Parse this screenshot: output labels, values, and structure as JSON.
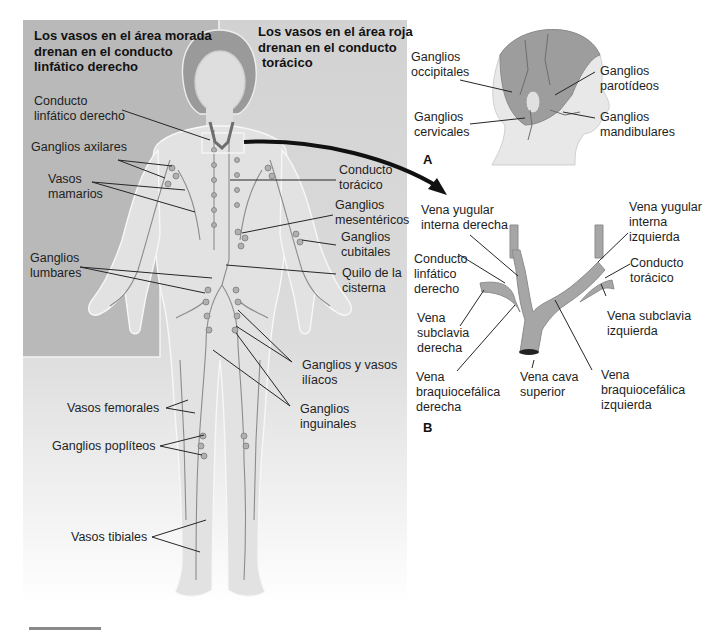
{
  "figure": {
    "colors": {
      "purple_region": "#b8b8b8",
      "red_region": "#c9c9c9",
      "body_fill": "#e4e4e4",
      "vessel": "#8c8c8c",
      "leader_line": "#2a2a2a",
      "background": "#ffffff"
    },
    "main_panel": {
      "header_left": [
        "Los vasos en el área morada",
        "drenan en el conducto",
        "linfático derecho"
      ],
      "header_right": [
        "Los vasos en el área roja",
        "drenan en el conducto",
        "torácico"
      ],
      "labels": {
        "conducto_linfatico_derecho": [
          "Conducto",
          "linfático derecho"
        ],
        "ganglios_axilares": [
          "Ganglios axilares"
        ],
        "vasos_mamarios": [
          "Vasos",
          "mamarios"
        ],
        "conducto_toracico": [
          "Conducto",
          "torácico"
        ],
        "ganglios_mesentericos": [
          "Ganglios",
          "mesentéricos"
        ],
        "ganglios_cubitales": [
          "Ganglios",
          "cubitales"
        ],
        "ganglios_lumbares": [
          "Ganglios",
          "lumbares"
        ],
        "quilo_cisterna": [
          "Quilo de la",
          "cisterna"
        ],
        "ganglios_vasos_iliacos": [
          "Ganglios y vasos",
          "ilíacos"
        ],
        "vasos_femorales": [
          "Vasos femorales"
        ],
        "ganglios_inguinales": [
          "Ganglios",
          "inguinales"
        ],
        "ganglios_popliteos": [
          "Ganglios poplíteos"
        ],
        "vasos_tibiales": [
          "Vasos tibiales"
        ]
      }
    },
    "panel_a": {
      "letter": "A",
      "labels": {
        "ganglios_occipitales": [
          "Ganglios",
          "occipitales"
        ],
        "ganglios_parotideos": [
          "Ganglios",
          "parotídeos"
        ],
        "ganglios_cervicales": [
          "Ganglios",
          "cervicales"
        ],
        "ganglios_mandibulares": [
          "Ganglios",
          "mandibulares"
        ]
      }
    },
    "panel_b": {
      "letter": "B",
      "labels": {
        "vena_yugular_interna_derecha": [
          "Vena yugular",
          "interna derecha"
        ],
        "vena_yugular_interna_izquierda": [
          "Vena yugular",
          "interna",
          "izquierda"
        ],
        "conducto_linfatico_derecho": [
          "Conducto",
          "linfático",
          "derecho"
        ],
        "conducto_toracico": [
          "Conducto",
          "torácico"
        ],
        "vena_subclavia_derecha": [
          "Vena",
          "subclavia",
          "derecha"
        ],
        "vena_subclavia_izquierda": [
          "Vena subclavia",
          "izquierda"
        ],
        "vena_braquiocefalica_derecha": [
          "Vena",
          "braquiocefálica",
          "derecha"
        ],
        "vena_cava_superior": [
          "Vena cava",
          "superior"
        ],
        "vena_braquiocefalica_izquierda": [
          "Vena",
          "braquiocefálica",
          "izquierda"
        ]
      }
    }
  }
}
